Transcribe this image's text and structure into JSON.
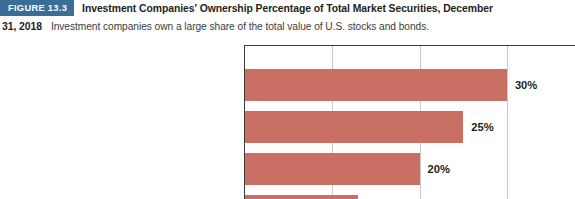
{
  "caption": {
    "badge": "FIGURE 13.3",
    "title_line1": "Investment Companies' Ownership Percentage of Total Market Securities, December",
    "title_line2": "31, 2018",
    "subtitle": "Investment companies own a large share of the total value of U.S. stocks and bonds.",
    "badge_color": "#3b6e97"
  },
  "chart_data": {
    "type": "bar",
    "orientation": "horizontal",
    "title": "Investment Companies' Ownership Percentage of Total Market Securities, December 31, 2018",
    "xlabel": "",
    "ylabel": "",
    "xlim": [
      0,
      35
    ],
    "grid": true,
    "gridline_values": [
      10,
      20,
      30
    ],
    "legend": "none",
    "bar_color": "#ca6f63",
    "categories": [
      "U.S. Stocks",
      "Municipal Bonds",
      "Corporate Bonds (U.S. and International)",
      "U.S. Treasury and Agency Securities"
    ],
    "values": [
      30,
      25,
      20,
      13
    ],
    "value_labels": [
      "30%",
      "25%",
      "20%",
      "13%"
    ]
  }
}
